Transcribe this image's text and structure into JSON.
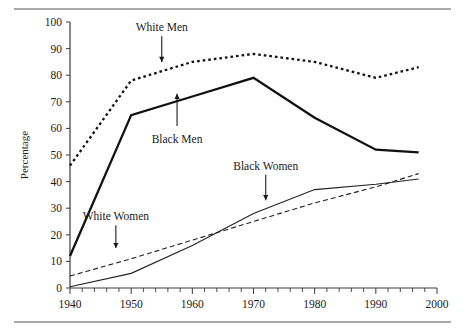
{
  "chart_data": {
    "type": "line",
    "title": "",
    "xlabel": "",
    "ylabel": "Percentage",
    "xlim": [
      1940,
      2000
    ],
    "ylim": [
      0,
      100
    ],
    "grid": false,
    "legend_position": "inline-annotations",
    "x_ticks": [
      "1940",
      "1950",
      "1960",
      "1970",
      "1980",
      "1990",
      "2000"
    ],
    "y_ticks": [
      "0",
      "10",
      "20",
      "30",
      "40",
      "50",
      "60",
      "70",
      "80",
      "90",
      "100"
    ],
    "x_minor_tick_interval": 2,
    "series": [
      {
        "name": "White Men",
        "style": "dotted-thick",
        "x": [
          1940,
          1950,
          1960,
          1970,
          1980,
          1990,
          1997
        ],
        "values": [
          46,
          78,
          85,
          88,
          85,
          79,
          83
        ]
      },
      {
        "name": "Black Men",
        "style": "solid-thick",
        "x": [
          1940,
          1950,
          1960,
          1970,
          1980,
          1990,
          1997
        ],
        "values": [
          12,
          65,
          72,
          79,
          64,
          52,
          51
        ]
      },
      {
        "name": "White Women",
        "style": "dashed-thin",
        "x": [
          1940,
          1950,
          1960,
          1970,
          1980,
          1990,
          1997
        ],
        "values": [
          4.5,
          11,
          18,
          25,
          32,
          38,
          43
        ]
      },
      {
        "name": "Black Women",
        "style": "solid-thin",
        "x": [
          1940,
          1950,
          1960,
          1970,
          1980,
          1990,
          1997
        ],
        "values": [
          0.5,
          5.5,
          16,
          28,
          37,
          39,
          41
        ]
      }
    ],
    "annotations": [
      {
        "label": "White Men",
        "label_x": 1955.0,
        "label_y": 98,
        "arrow_to_y": 85
      },
      {
        "label": "Black Men",
        "label_x": 1957.5,
        "label_y": 56,
        "arrow_to_y": 73
      },
      {
        "label": "White Women",
        "label_x": 1947.5,
        "label_y": 27,
        "arrow_to_y": 15
      },
      {
        "label": "Black Women",
        "label_x": 1972.0,
        "label_y": 46,
        "arrow_to_y": 33
      }
    ]
  },
  "colors": {
    "ink": "#1a1a1a",
    "axis": "#3a3a3a",
    "rule": "#555555",
    "background": "#ffffff"
  }
}
